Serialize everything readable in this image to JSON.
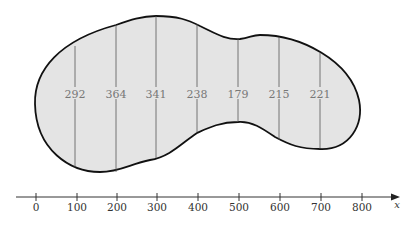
{
  "diagram": {
    "type": "region-width-measurements",
    "fill_color": "#e4e4e4",
    "outline_color": "#111111",
    "measurements": [
      {
        "x": 100,
        "width": "292"
      },
      {
        "x": 200,
        "width": "364"
      },
      {
        "x": 300,
        "width": "341"
      },
      {
        "x": 400,
        "width": "238"
      },
      {
        "x": 500,
        "width": "179"
      },
      {
        "x": 600,
        "width": "215"
      },
      {
        "x": 700,
        "width": "221"
      }
    ],
    "axis": {
      "label": "x",
      "ticks": [
        "0",
        "100",
        "200",
        "300",
        "400",
        "500",
        "600",
        "700",
        "800"
      ]
    }
  }
}
